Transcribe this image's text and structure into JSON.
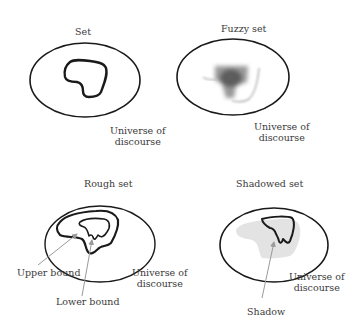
{
  "panels": [
    {
      "id": "set",
      "title": "Set",
      "universe_label_line1": "Universe of",
      "universe_label_line2": "discourse"
    },
    {
      "id": "fuzzy-set",
      "title": "Fuzzy set",
      "universe_label_line1": "Universe of",
      "universe_label_line2": "discourse"
    },
    {
      "id": "rough-set",
      "title": "Rough set",
      "universe_label_line1": "Universe of",
      "universe_label_line2": "discourse",
      "annotations": {
        "upper": "Upper bound",
        "lower": "Lower bound"
      }
    },
    {
      "id": "shadowed-set",
      "title": "Shadowed set",
      "universe_label_line1": "Universe of",
      "universe_label_line2": "discourse",
      "annotations": {
        "shadow": "Shadow"
      }
    }
  ],
  "colors": {
    "outline": "#1a1a1a",
    "fuzzy_core": "#555555",
    "shadow_fill": "#e3e3e3",
    "arrow": "#9a9a9a",
    "text": "#3a3a3a"
  }
}
